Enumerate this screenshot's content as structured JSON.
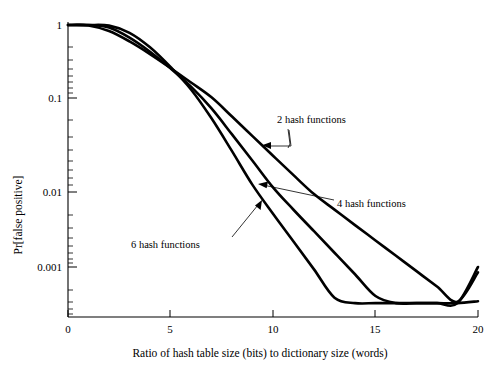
{
  "chart_data": {
    "type": "line",
    "title": "",
    "subtitle": "",
    "xlabel": "Ratio of hash table size (bits) to dictionary size (words)",
    "ylabel": "Pr[false positive]",
    "xlim": [
      0,
      20
    ],
    "ylim": [
      0.0003,
      1
    ],
    "yscale": "log",
    "xscale": "linear",
    "grid": false,
    "legend_position": "inline-annotations",
    "xticks": [
      0,
      5,
      10,
      15,
      20
    ],
    "xtick_labels": [
      "0",
      "5",
      "10",
      "15",
      "20"
    ],
    "yticks": [
      1,
      0.1,
      0.01,
      0.001
    ],
    "ytick_labels": [
      "1",
      "0.1",
      "0.01",
      "0.001"
    ],
    "x": [
      0,
      1,
      2,
      3,
      4,
      5,
      6,
      7,
      8,
      9,
      10,
      11,
      12,
      13,
      14,
      15,
      16,
      17,
      18,
      19,
      20
    ],
    "series": [
      {
        "name": "2 hash functions",
        "values": [
          1.0,
          0.985,
          0.827,
          0.596,
          0.4,
          0.258,
          0.163,
          0.102,
          0.0635,
          0.0393,
          0.0243,
          0.0151,
          0.00937,
          0.00582,
          0.00362,
          0.00226,
          0.00141,
          0.00088,
          0.00055,
          0.000345,
          0.00085
        ]
      },
      {
        "name": "4 hash functions",
        "values": [
          1.0,
          0.998,
          0.924,
          0.672,
          0.431,
          0.255,
          0.143,
          0.0774,
          0.041,
          0.0215,
          0.0112,
          0.0058,
          0.003,
          0.00155,
          0.0008,
          0.00041,
          0.00021,
          0.00011,
          5.6e-05,
          2.9e-05,
          0.001
        ]
      },
      {
        "name": "6 hash functions",
        "values": [
          1.0,
          1.0,
          0.981,
          0.782,
          0.495,
          0.266,
          0.131,
          0.0608,
          0.0272,
          0.0119,
          0.00513,
          0.00219,
          0.00093,
          0.00039,
          0.000164,
          6.88e-05,
          2.88e-05,
          1.2e-05,
          5e-06,
          2.1e-06,
          0.00035
        ]
      }
    ],
    "annotations": [
      {
        "text": "2 hash functions",
        "target_x": 11.1,
        "target_y": 0.0175
      },
      {
        "text": "4 hash functions",
        "target_x": 10.1,
        "target_y": 0.0115
      },
      {
        "text": "6 hash functions",
        "target_x": 9.3,
        "target_y": 0.0078
      }
    ]
  },
  "axes": {
    "y_label": "Pr[false positive]",
    "x_label": "Ratio of hash table size (bits) to dictionary size (words)",
    "y_tick_1": "1",
    "y_tick_01": "0.1",
    "y_tick_001": "0.01",
    "y_tick_0001": "0.001",
    "x_tick_0": "0",
    "x_tick_5": "5",
    "x_tick_10": "10",
    "x_tick_15": "15",
    "x_tick_20": "20"
  },
  "annotation_labels": {
    "two_hash": "2 hash functions",
    "four_hash": "4 hash functions",
    "six_hash": "6 hash functions"
  },
  "colors": {
    "background": "#ffffff",
    "ink": "#000000",
    "curve": "#000000"
  }
}
